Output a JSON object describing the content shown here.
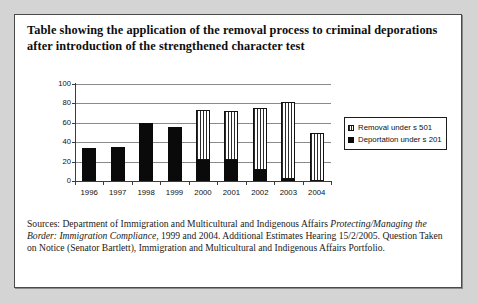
{
  "card": {
    "title": "Table showing the application of the removal process to criminal deporations after introduction of the strengthened character test",
    "footer_line1_pre": "Sources: Department of Immigration and Multicultural and Indigenous Affairs ",
    "footer_italic1": "Protecting/Managing the Border: Immigration Compliance",
    "footer_line1_post": ", 1999 and 2004. Additional Estimates Hearing 15/2/2005. Question Taken on Notice (Senator Bartlett), Immigration and Multicultural and Indigenous Affairs Portfolio."
  },
  "legend": {
    "items": [
      {
        "label": "Removal under s 501",
        "swatch": "hatched-white"
      },
      {
        "label": "Deportation under s 201",
        "swatch": "solid-black"
      }
    ]
  },
  "chart_data": {
    "type": "bar",
    "title": "Table showing the application of the removal process to criminal deporations after introduction of the strengthened character test",
    "xlabel": "",
    "ylabel": "",
    "ylim": [
      0,
      100
    ],
    "yticks": [
      0,
      20,
      40,
      60,
      80,
      100
    ],
    "grid": true,
    "stacked": true,
    "legend_position": "right",
    "categories": [
      "1996",
      "1997",
      "1998",
      "1999",
      "2000",
      "2001",
      "2002",
      "2003",
      "2004"
    ],
    "series": [
      {
        "name": "Deportation under s 201",
        "values": [
          34,
          35,
          60,
          56,
          22,
          22,
          11,
          2,
          0
        ]
      },
      {
        "name": "Removal under s 501",
        "values": [
          0,
          0,
          0,
          0,
          51,
          50,
          64,
          79,
          49
        ]
      }
    ],
    "totals": [
      34,
      35,
      60,
      56,
      73,
      72,
      75,
      81,
      49
    ]
  }
}
